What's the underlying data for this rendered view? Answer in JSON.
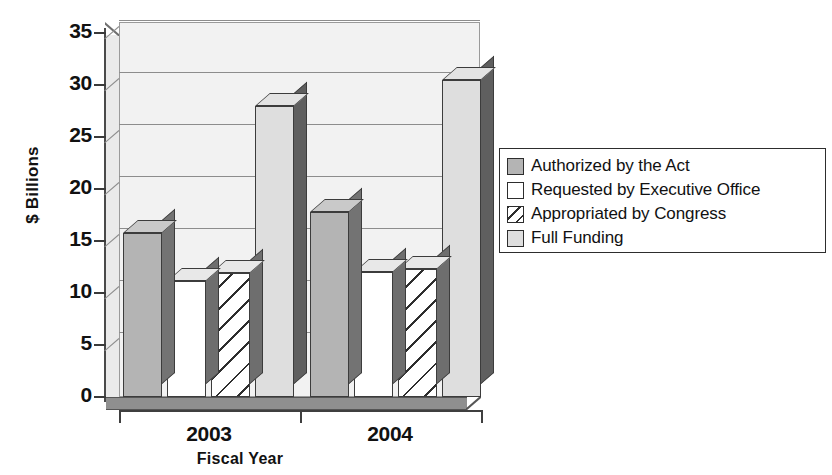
{
  "chart_data": {
    "type": "bar",
    "title": "",
    "xlabel": "Fiscal Year",
    "ylabel": "$ Billions",
    "categories": [
      "2003",
      "2004"
    ],
    "ylim": [
      0,
      35
    ],
    "yticks": [
      0,
      5,
      10,
      15,
      20,
      25,
      30,
      35
    ],
    "ytick_labels": [
      "0",
      "5",
      "10",
      "15",
      "20",
      "25",
      "30",
      "35"
    ],
    "grid": true,
    "legend_position": "right",
    "style": "3d-clustered-column",
    "series": [
      {
        "name": "Authorized by the Act",
        "swatch": "sw-auth",
        "color": "#b4b4b4",
        "values": [
          15.8,
          17.8
        ]
      },
      {
        "name": "Requested by Executive Office",
        "swatch": "sw-req",
        "color": "#ffffff",
        "values": [
          11.2,
          12.0
        ]
      },
      {
        "name": "Appropriated by Congress",
        "swatch": "sw-appr",
        "color": "#ffffff-hatched",
        "values": [
          11.9,
          12.3
        ]
      },
      {
        "name": "Full Funding",
        "swatch": "sw-full",
        "color": "#dedede",
        "values": [
          28.0,
          30.5
        ]
      }
    ]
  }
}
